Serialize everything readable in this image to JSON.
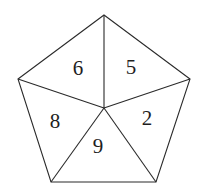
{
  "diagram": {
    "shape": "regular pentagon divided into 5 triangles from center",
    "vertices": {
      "top": [
        104,
        15
      ],
      "right": [
        190,
        79
      ],
      "bottom_right": [
        156,
        182
      ],
      "bottom_left": [
        51,
        182
      ],
      "left": [
        18,
        79
      ]
    },
    "center": [
      104,
      108
    ],
    "regions": [
      {
        "id": "top-left",
        "label": "6",
        "pos": [
          78,
          68
        ]
      },
      {
        "id": "top-right",
        "label": "5",
        "pos": [
          131,
          67
        ]
      },
      {
        "id": "right",
        "label": "2",
        "pos": [
          147,
          118
        ]
      },
      {
        "id": "bottom",
        "label": "9",
        "pos": [
          98,
          146
        ]
      },
      {
        "id": "left",
        "label": "8",
        "pos": [
          55,
          121
        ]
      }
    ]
  }
}
